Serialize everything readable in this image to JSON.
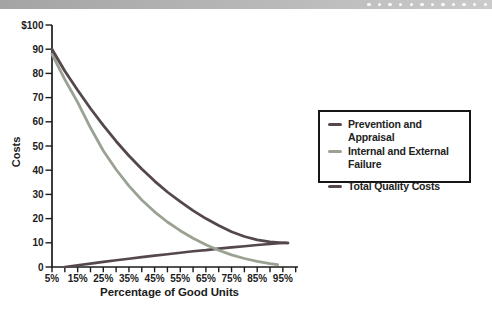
{
  "header": {
    "dots": 12
  },
  "chart_data": {
    "type": "line",
    "title": "",
    "xlabel": "Percentage of Good Units",
    "ylabel": "Costs",
    "x_axis": {
      "range": [
        5,
        100
      ],
      "major_ticks": [
        {
          "v": 5,
          "label": "5%"
        },
        {
          "v": 15,
          "label": "15%"
        },
        {
          "v": 25,
          "label": "25%"
        },
        {
          "v": 35,
          "label": "35%"
        },
        {
          "v": 45,
          "label": "45%"
        },
        {
          "v": 55,
          "label": "55%"
        },
        {
          "v": 65,
          "label": "65%"
        },
        {
          "v": 75,
          "label": "75%"
        },
        {
          "v": 85,
          "label": "85%"
        },
        {
          "v": 95,
          "label": "95%"
        }
      ],
      "minor_tick_values": [
        5,
        10,
        15,
        20,
        25,
        30,
        35,
        40,
        45,
        50,
        55,
        60,
        65,
        70,
        75,
        80,
        85,
        90,
        95,
        100
      ]
    },
    "y_axis": {
      "range": [
        0,
        100
      ],
      "ticks": [
        {
          "v": 0,
          "label": "0"
        },
        {
          "v": 10,
          "label": "10"
        },
        {
          "v": 20,
          "label": "20"
        },
        {
          "v": 30,
          "label": "30"
        },
        {
          "v": 40,
          "label": "40"
        },
        {
          "v": 50,
          "label": "50"
        },
        {
          "v": 60,
          "label": "60"
        },
        {
          "v": 70,
          "label": "70"
        },
        {
          "v": 80,
          "label": "80"
        },
        {
          "v": 90,
          "label": "90"
        },
        {
          "v": 100,
          "label": "$100"
        }
      ]
    },
    "legend": {
      "position": "right-middle",
      "boxed": true
    },
    "series": [
      {
        "name": "Prevention and Appraisal",
        "color": "#55484c",
        "points": [
          [
            10,
            0
          ],
          [
            15,
            0.7
          ],
          [
            20,
            1.4
          ],
          [
            25,
            2.1
          ],
          [
            30,
            2.8
          ],
          [
            35,
            3.4
          ],
          [
            40,
            4.1
          ],
          [
            45,
            4.7
          ],
          [
            50,
            5.3
          ],
          [
            55,
            5.9
          ],
          [
            60,
            6.5
          ],
          [
            65,
            7.0
          ],
          [
            70,
            7.6
          ],
          [
            75,
            8.1
          ],
          [
            80,
            8.6
          ],
          [
            85,
            9.1
          ],
          [
            90,
            9.5
          ],
          [
            96,
            10
          ]
        ]
      },
      {
        "name": "Internal and External Failure",
        "color": "#9aa294",
        "points": [
          [
            5,
            88
          ],
          [
            10,
            77.5
          ],
          [
            15,
            68
          ],
          [
            20,
            57.5
          ],
          [
            25,
            48
          ],
          [
            30,
            40.3
          ],
          [
            35,
            33.5
          ],
          [
            40,
            27.7
          ],
          [
            45,
            22.8
          ],
          [
            50,
            18.6
          ],
          [
            55,
            15
          ],
          [
            60,
            11.9
          ],
          [
            65,
            9.2
          ],
          [
            70,
            6.9
          ],
          [
            75,
            5
          ],
          [
            80,
            3.5
          ],
          [
            85,
            2.3
          ],
          [
            90,
            1.4
          ],
          [
            93,
            1
          ]
        ]
      },
      {
        "name": "Total Quality Costs",
        "color": "#55484c",
        "points": [
          [
            5,
            90
          ],
          [
            10,
            81
          ],
          [
            15,
            73
          ],
          [
            20,
            65.5
          ],
          [
            25,
            58.5
          ],
          [
            30,
            52
          ],
          [
            35,
            46
          ],
          [
            40,
            40.5
          ],
          [
            45,
            35.5
          ],
          [
            50,
            31
          ],
          [
            55,
            27
          ],
          [
            60,
            23.3
          ],
          [
            65,
            20
          ],
          [
            70,
            17.1
          ],
          [
            75,
            14.6
          ],
          [
            80,
            12.6
          ],
          [
            85,
            11.2
          ],
          [
            90,
            10.4
          ],
          [
            95,
            10
          ],
          [
            97,
            9.9
          ]
        ]
      }
    ]
  }
}
